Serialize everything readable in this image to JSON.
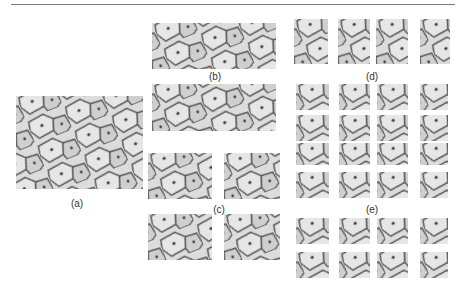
{
  "figure": {
    "labels": {
      "a": "(a)",
      "b": "(b)",
      "c": "(c)",
      "d": "(d)",
      "e": "(e)"
    }
  },
  "colors": {
    "cell_fill": "#d6d6d6",
    "cell_light": "#e8e8e8",
    "cell_wall": "#555555",
    "nucleus": "#3a3a3a",
    "rule": "#7a7a7a"
  }
}
